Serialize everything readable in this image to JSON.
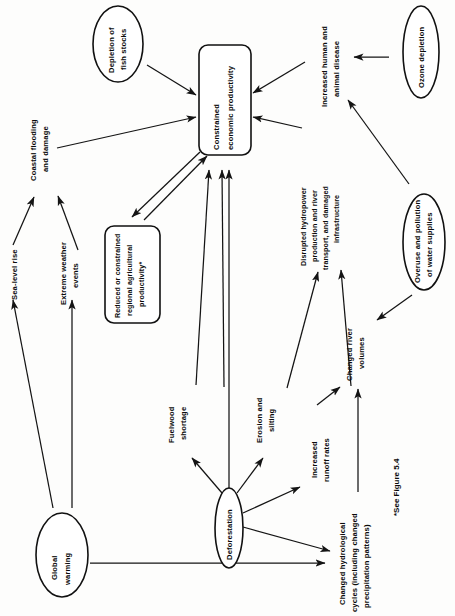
{
  "figure": {
    "footnote": "*See Figure 5.4",
    "orientation": "rotated-90-counterclockwise",
    "ink_color": "#111111",
    "paper_color": "#fdfdfc"
  },
  "nodes": {
    "constrained_economic_productivity": {
      "label_line1": "Constrained",
      "label_line2": "economic productivity",
      "shape": "rounded-rectangle"
    },
    "depletion_of_fish_stocks": {
      "label_line1": "Depletion of",
      "label_line2": "fish stocks",
      "shape": "ellipse"
    },
    "ozone_depletion": {
      "label_line1": "Ozone depletion",
      "label_line2": "",
      "shape": "ellipse"
    },
    "overuse_and_pollution_of_water_supplies": {
      "label_line1": "Overuse and pollution",
      "label_line2": "of water supplies",
      "shape": "ellipse"
    },
    "global_warming": {
      "label_line1": "Global",
      "label_line2": "warming",
      "shape": "ellipse"
    },
    "deforestation": {
      "label_line1": "Deforestation",
      "label_line2": "",
      "shape": "ellipse"
    },
    "reduced_or_constrained_regional_agricultural_productivity": {
      "label_line1": "Reduced or constrained",
      "label_line2": "regional agricultural",
      "label_line3": "productivity*",
      "shape": "rounded-rectangle"
    },
    "increased_human_and_animal_disease": {
      "label_line1": "Increased human and",
      "label_line2": "animal disease",
      "shape": "text"
    },
    "coastal_flooding_and_damage": {
      "label_line1": "Coastal flooding",
      "label_line2": "and damage",
      "shape": "text"
    },
    "sea_level_rise": {
      "label_line1": "Sea-level rise",
      "label_line2": "",
      "shape": "text"
    },
    "extreme_weather_events": {
      "label_line1": "Extreme weather",
      "label_line2": "events",
      "shape": "text"
    },
    "disrupted_hydropower": {
      "label_line1": "Disrupted hydropower",
      "label_line2": "production and river",
      "label_line3": "transport, and damaged",
      "label_line4": "infrastructure",
      "shape": "text"
    },
    "changed_river_volumes": {
      "label_line1": "Changed river",
      "label_line2": "volumes",
      "shape": "text"
    },
    "fuelwood_shortage": {
      "label_line1": "Fuelwood",
      "label_line2": "shortage",
      "shape": "text"
    },
    "erosion_and_silting": {
      "label_line1": "Erosion and",
      "label_line2": "silting",
      "shape": "text"
    },
    "increased_runoff_rates": {
      "label_line1": "Increased",
      "label_line2": "runoff rates",
      "shape": "text"
    },
    "changed_hydrological_cycles": {
      "label_line1": "Changed hydrological",
      "label_line2": "cycles (including changed",
      "label_line3": "precipitation patterns)",
      "shape": "text"
    }
  },
  "edges": [
    {
      "from": "depletion_of_fish_stocks",
      "to": "constrained_economic_productivity"
    },
    {
      "from": "coastal_flooding_and_damage",
      "to": "constrained_economic_productivity"
    },
    {
      "from": "increased_human_and_animal_disease",
      "to": "constrained_economic_productivity"
    },
    {
      "from": "disrupted_hydropower",
      "to": "constrained_economic_productivity"
    },
    {
      "from": "reduced_or_constrained_regional_agricultural_productivity",
      "to": "constrained_economic_productivity"
    },
    {
      "from": "constrained_economic_productivity",
      "to": "reduced_or_constrained_regional_agricultural_productivity"
    },
    {
      "from": "fuelwood_shortage",
      "to": "constrained_economic_productivity"
    },
    {
      "from": "erosion_and_silting",
      "to": "constrained_economic_productivity"
    },
    {
      "from": "ozone_depletion",
      "to": "increased_human_and_animal_disease"
    },
    {
      "from": "overuse_and_pollution_of_water_supplies",
      "to": "increased_human_and_animal_disease"
    },
    {
      "from": "overuse_and_pollution_of_water_supplies",
      "to": "changed_river_volumes"
    },
    {
      "from": "changed_river_volumes",
      "to": "disrupted_hydropower"
    },
    {
      "from": "erosion_and_silting",
      "to": "disrupted_hydropower"
    },
    {
      "from": "increased_runoff_rates",
      "to": "changed_river_volumes"
    },
    {
      "from": "changed_hydrological_cycles",
      "to": "changed_river_volumes"
    },
    {
      "from": "deforestation",
      "to": "fuelwood_shortage"
    },
    {
      "from": "deforestation",
      "to": "erosion_and_silting"
    },
    {
      "from": "deforestation",
      "to": "increased_runoff_rates"
    },
    {
      "from": "deforestation",
      "to": "changed_hydrological_cycles"
    },
    {
      "from": "deforestation",
      "to": "constrained_economic_productivity"
    },
    {
      "from": "global_warming",
      "to": "sea_level_rise"
    },
    {
      "from": "global_warming",
      "to": "extreme_weather_events"
    },
    {
      "from": "global_warming",
      "to": "changed_hydrological_cycles"
    },
    {
      "from": "sea_level_rise",
      "to": "coastal_flooding_and_damage"
    },
    {
      "from": "extreme_weather_events",
      "to": "coastal_flooding_and_damage"
    }
  ]
}
